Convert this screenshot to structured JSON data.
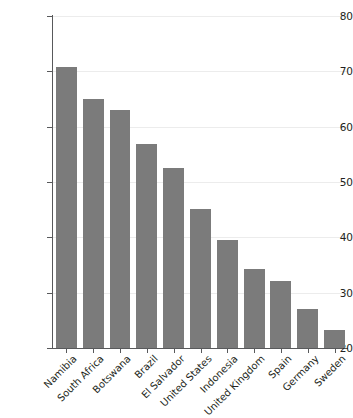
{
  "chart_data": {
    "type": "bar",
    "title": "",
    "subtitle": "",
    "xlabel": "",
    "ylabel": "Gini coefficient (x100)",
    "categories": [
      "Namibia",
      "South Africa",
      "Botswana",
      "Brazil",
      "El Salvador",
      "United States",
      "Indonesia",
      "United Kingdom",
      "Spain",
      "Germany",
      "Sweden"
    ],
    "values": [
      70.7,
      65.0,
      63.1,
      56.8,
      52.5,
      45.2,
      39.5,
      34.3,
      32.1,
      27.1,
      23.2
    ],
    "series": [
      {
        "name": "Gini coefficient",
        "values": [
          70.7,
          65.0,
          63.1,
          56.8,
          52.5,
          45.2,
          39.5,
          34.3,
          32.1,
          27.1,
          23.2
        ]
      }
    ],
    "ylim": [
      20,
      80
    ],
    "yticks": [
      20,
      30,
      40,
      50,
      60,
      70,
      80
    ],
    "ytick_labels": [
      "20",
      "30",
      "40",
      "50",
      "60",
      "70",
      "80"
    ],
    "grid": "horizontal",
    "legend": "none",
    "bar_color": "#7b7b7b",
    "gridline_color": "#ececec",
    "axis_color": "#58595b",
    "background": "#ffffff"
  }
}
